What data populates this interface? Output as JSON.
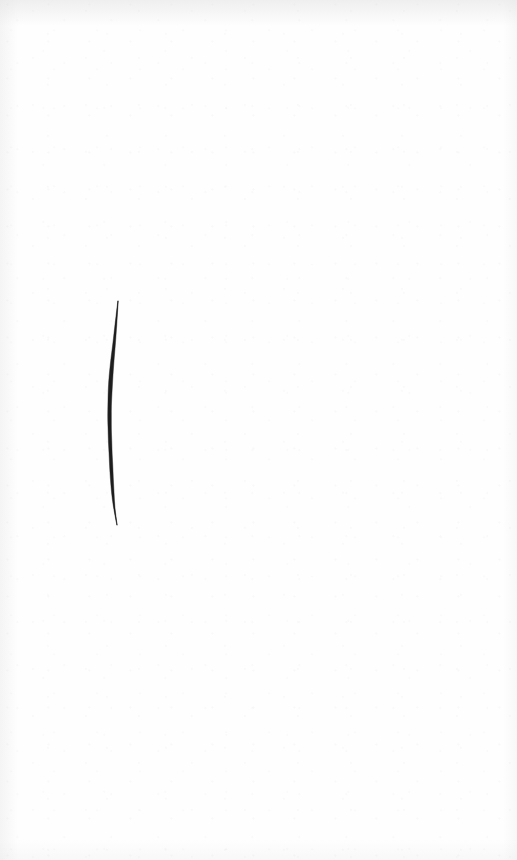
{
  "page": {
    "width": 517,
    "height": 860,
    "background_color": "#fefefe",
    "surface": "blank white paper",
    "visible_text": "",
    "caption": "Blank white page with a single vertical ink stroke"
  },
  "artwork": {
    "name": "vertical ink stroke",
    "medium": "ink brush / pen on paper",
    "ink_color": "#1a1a1a",
    "mark_count": 1,
    "orientation": "vertical",
    "position": {
      "top_x": 118,
      "top_y": 301,
      "bottom_x": 117,
      "bottom_y": 525
    },
    "length_px": 224,
    "max_width_px": 4,
    "description": "A single near-vertical stroke that begins as a hairline, thickens through the middle, bows slightly to the left, then tapers to a fine tail at the bottom."
  },
  "stroke_data": {
    "type": "path",
    "samples": [
      {
        "y": 301,
        "x": 118.0,
        "width": 0.4
      },
      {
        "y": 310,
        "x": 117.2,
        "width": 0.9
      },
      {
        "y": 320,
        "x": 116.3,
        "width": 1.5
      },
      {
        "y": 332,
        "x": 115.2,
        "width": 2.1
      },
      {
        "y": 345,
        "x": 114.0,
        "width": 2.6
      },
      {
        "y": 358,
        "x": 112.6,
        "width": 3.2
      },
      {
        "y": 370,
        "x": 111.5,
        "width": 3.6
      },
      {
        "y": 382,
        "x": 110.6,
        "width": 3.9
      },
      {
        "y": 394,
        "x": 110.0,
        "width": 3.8
      },
      {
        "y": 406,
        "x": 109.6,
        "width": 3.4
      },
      {
        "y": 418,
        "x": 109.5,
        "width": 3.6
      },
      {
        "y": 430,
        "x": 109.7,
        "width": 3.2
      },
      {
        "y": 442,
        "x": 110.1,
        "width": 3.4
      },
      {
        "y": 454,
        "x": 110.6,
        "width": 3.0
      },
      {
        "y": 466,
        "x": 111.2,
        "width": 3.2
      },
      {
        "y": 478,
        "x": 111.8,
        "width": 2.9
      },
      {
        "y": 490,
        "x": 112.6,
        "width": 2.6
      },
      {
        "y": 500,
        "x": 113.4,
        "width": 2.0
      },
      {
        "y": 508,
        "x": 114.3,
        "width": 1.3
      },
      {
        "y": 516,
        "x": 115.5,
        "width": 0.8
      },
      {
        "y": 525,
        "x": 117.0,
        "width": 0.3
      }
    ]
  }
}
